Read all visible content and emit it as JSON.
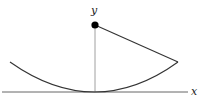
{
  "diagram": {
    "type": "parabola-focus",
    "labels": {
      "x_axis": "x",
      "y_axis": "y"
    },
    "colors": {
      "curve": "#333333",
      "segment": "#333333",
      "axis_x": "#555555",
      "axis_y": "#888888",
      "focus": "#000000",
      "background": "#ffffff"
    },
    "elements": {
      "x_axis": {
        "x1": 2,
        "y1": 92,
        "x2": 188,
        "y2": 92
      },
      "y_axis": {
        "x1": 95,
        "y1": 25,
        "x2": 95,
        "y2": 92
      },
      "focus_point": {
        "cx": 95,
        "cy": 25,
        "r": 3.6
      },
      "parabola": {
        "left": [
          10,
          62
        ],
        "vertex": [
          95,
          92
        ],
        "right": [
          178,
          62
        ]
      },
      "segment": {
        "from": [
          95,
          25
        ],
        "to": [
          178,
          62
        ]
      }
    }
  }
}
